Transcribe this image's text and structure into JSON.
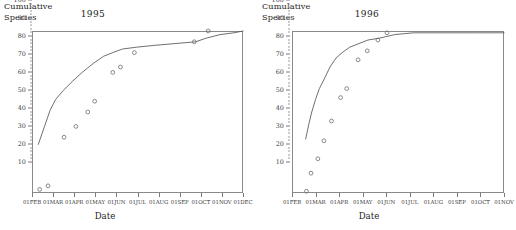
{
  "figure": {
    "axis_label_y": "Cumulative\nSpecies",
    "axis_label_x": "Date",
    "panels": [
      {
        "title": "1995"
      },
      {
        "title": "1996"
      }
    ]
  },
  "chart_data": [
    {
      "type": "scatter",
      "title": "1995",
      "xlabel": "Date",
      "ylabel": "Cumulative Species",
      "ylim": [
        10,
        100
      ],
      "yticks": [
        10,
        20,
        30,
        40,
        50,
        60,
        70,
        80,
        90,
        100
      ],
      "ytick_labels": [
        "10",
        "20",
        "30",
        "40",
        "50",
        "60",
        "70",
        "80",
        "90",
        "100"
      ],
      "xtick_labels": [
        "01FEB",
        "01MAR",
        "01APR",
        "01MAY",
        "01JUN",
        "01JUL",
        "01AUG",
        "01SEP",
        "01OCT",
        "01NOV",
        "01DEC"
      ],
      "xlim_days": [
        0,
        303
      ],
      "grid": false,
      "legend": null,
      "series": [
        {
          "name": "Observed cumulative species",
          "marker": "open-circle",
          "points": [
            {
              "x_label": "12FEB",
              "x_day": 11,
              "y": 12
            },
            {
              "x_label": "24FEB",
              "x_day": 23,
              "y": 14
            },
            {
              "x_label": "19MAR",
              "x_day": 46,
              "y": 41
            },
            {
              "x_label": "05APR",
              "x_day": 63,
              "y": 47
            },
            {
              "x_label": "22APR",
              "x_day": 80,
              "y": 55
            },
            {
              "x_label": "02MAY",
              "x_day": 90,
              "y": 61
            },
            {
              "x_label": "28MAY",
              "x_day": 116,
              "y": 77
            },
            {
              "x_label": "08JUN",
              "x_day": 127,
              "y": 80
            },
            {
              "x_label": "28JUN",
              "x_day": 147,
              "y": 88
            },
            {
              "x_label": "22SEP",
              "x_day": 233,
              "y": 94
            },
            {
              "x_label": "12OCT",
              "x_day": 253,
              "y": 100
            }
          ]
        },
        {
          "name": "Fitted accumulation curve",
          "marker": "line",
          "points": [
            {
              "x_day": 9,
              "y": 37
            },
            {
              "x_day": 18,
              "y": 47
            },
            {
              "x_day": 26,
              "y": 56
            },
            {
              "x_day": 34,
              "y": 62
            },
            {
              "x_day": 45,
              "y": 67
            },
            {
              "x_day": 58,
              "y": 72
            },
            {
              "x_day": 72,
              "y": 77
            },
            {
              "x_day": 88,
              "y": 82
            },
            {
              "x_day": 103,
              "y": 86
            },
            {
              "x_day": 116,
              "y": 88
            },
            {
              "x_day": 130,
              "y": 90
            },
            {
              "x_day": 150,
              "y": 91
            },
            {
              "x_day": 175,
              "y": 92
            },
            {
              "x_day": 205,
              "y": 93
            },
            {
              "x_day": 235,
              "y": 94
            },
            {
              "x_day": 250,
              "y": 96
            },
            {
              "x_day": 270,
              "y": 98
            },
            {
              "x_day": 290,
              "y": 99
            },
            {
              "x_day": 303,
              "y": 100
            }
          ]
        }
      ]
    },
    {
      "type": "scatter",
      "title": "1996",
      "xlabel": "Date",
      "ylabel": "Cumulative Species",
      "ylim": [
        10,
        100
      ],
      "yticks": [
        10,
        20,
        30,
        40,
        50,
        60,
        70,
        80,
        90,
        100
      ],
      "ytick_labels": [
        "10",
        "20",
        "30",
        "40",
        "50",
        "60",
        "70",
        "80",
        "90",
        "100"
      ],
      "xtick_labels": [
        "01FEB",
        "01MAR",
        "01APR",
        "01MAY",
        "01JUN",
        "01JUL",
        "01AUG",
        "01SEP",
        "01OCT",
        "01NOV"
      ],
      "xlim_days": [
        0,
        279
      ],
      "grid": false,
      "legend": null,
      "series": [
        {
          "name": "Observed cumulative species",
          "marker": "open-circle",
          "points": [
            {
              "x_label": "20FEB",
              "x_day": 19,
              "y": 11
            },
            {
              "x_label": "26FEB",
              "x_day": 25,
              "y": 21
            },
            {
              "x_label": "06MAR",
              "x_day": 34,
              "y": 29
            },
            {
              "x_label": "14MAR",
              "x_day": 42,
              "y": 39
            },
            {
              "x_label": "24MAR",
              "x_day": 52,
              "y": 50
            },
            {
              "x_label": "05APR",
              "x_day": 64,
              "y": 63
            },
            {
              "x_label": "13APR",
              "x_day": 72,
              "y": 68
            },
            {
              "x_label": "28APR",
              "x_day": 87,
              "y": 84
            },
            {
              "x_label": "10MAY",
              "x_day": 99,
              "y": 89
            },
            {
              "x_label": "24MAY",
              "x_day": 113,
              "y": 95
            },
            {
              "x_label": "05JUN",
              "x_day": 125,
              "y": 99
            }
          ]
        },
        {
          "name": "Fitted accumulation curve",
          "marker": "line",
          "points": [
            {
              "x_day": 18,
              "y": 40
            },
            {
              "x_day": 22,
              "y": 48
            },
            {
              "x_day": 26,
              "y": 55
            },
            {
              "x_day": 31,
              "y": 62
            },
            {
              "x_day": 36,
              "y": 68
            },
            {
              "x_day": 42,
              "y": 73
            },
            {
              "x_day": 50,
              "y": 80
            },
            {
              "x_day": 58,
              "y": 85
            },
            {
              "x_day": 66,
              "y": 88
            },
            {
              "x_day": 76,
              "y": 91
            },
            {
              "x_day": 88,
              "y": 93
            },
            {
              "x_day": 100,
              "y": 95
            },
            {
              "x_day": 115,
              "y": 96
            },
            {
              "x_day": 135,
              "y": 98
            },
            {
              "x_day": 160,
              "y": 99
            },
            {
              "x_day": 200,
              "y": 99
            },
            {
              "x_day": 240,
              "y": 99
            },
            {
              "x_day": 279,
              "y": 99
            }
          ]
        }
      ]
    }
  ]
}
